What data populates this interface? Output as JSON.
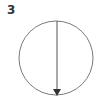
{
  "figure": {
    "label": "3",
    "circle": {
      "cx": 56,
      "cy": 58,
      "r": 37,
      "stroke": "#7a7a7a"
    },
    "arrow": {
      "x": 57,
      "y1": 21,
      "y2": 95,
      "direction": "down",
      "stroke": "#555555"
    }
  }
}
